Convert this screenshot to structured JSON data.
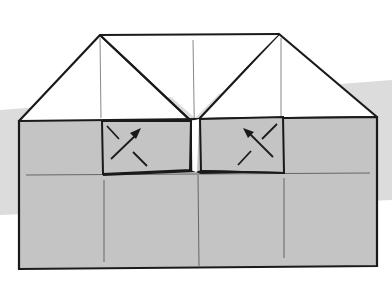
{
  "diagram": {
    "type": "origami-fold-step",
    "colors": {
      "paper_shaded": "#c4c4c4",
      "paper_white": "#ffffff",
      "background_band": "#dcdcdc",
      "outline": "#1a1a1a",
      "crease": "#777777"
    },
    "flaps": [
      {
        "name": "left-flap",
        "arrow_direction": "up-right"
      },
      {
        "name": "right-flap",
        "arrow_direction": "up-left"
      }
    ]
  }
}
